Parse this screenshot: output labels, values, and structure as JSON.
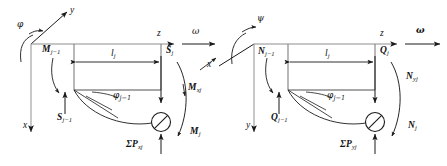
{
  "figure": {
    "type": "engineering-free-body-diagram",
    "stroke_color": "#1a1a1a",
    "background_color": "#ffffff"
  },
  "left_diagram": {
    "name": "x-z plane free body diagram",
    "axes": {
      "vertical_axis": "x",
      "horizontal_axis": "z",
      "oblique_axis": "y"
    },
    "rotation_symbol": "φ",
    "angular_velocity_symbol": "ω",
    "length_label": "l",
    "length_sub": "j",
    "labels": {
      "moment_left": "M",
      "moment_left_sub": "j−1",
      "shear_left": "S",
      "shear_left_sub": "j−1",
      "shear_right": "S",
      "shear_right_sub": "j",
      "moment_axial": "M",
      "moment_axial_sub": "xj",
      "moment_right": "M",
      "moment_right_sub": "j",
      "angle": "φ",
      "angle_sub": "j−1",
      "load_sum_prefix": "Σ",
      "load_sum": "P",
      "load_sum_sub": "xj"
    }
  },
  "right_diagram": {
    "name": "y-z plane free body diagram",
    "axes": {
      "vertical_axis": "y",
      "horizontal_axis": "z",
      "oblique_axis": "x"
    },
    "rotation_symbol": "ψ",
    "angular_velocity_symbol": "ω",
    "length_label": "l",
    "length_sub": "j",
    "labels": {
      "moment_left": "N",
      "moment_left_sub": "j−1",
      "shear_left": "Q",
      "shear_left_sub": "j−1",
      "shear_right": "Q",
      "shear_right_sub": "j",
      "moment_axial": "N",
      "moment_axial_sub": "yj",
      "moment_right": "N",
      "moment_right_sub": "j",
      "angle": "φ",
      "angle_sub": "j−1",
      "load_sum_prefix": "Σ",
      "load_sum": "P",
      "load_sum_sub": "yj"
    }
  }
}
